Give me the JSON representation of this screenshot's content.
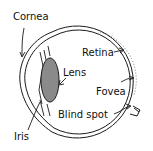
{
  "diagram": {
    "labels": {
      "cornea": "Cornea",
      "retina": "Retina",
      "lens": "Lens",
      "fovea": "Fovea",
      "blind_spot": "Blind spot",
      "iris": "Iris"
    },
    "colors": {
      "line": "#1a1a1a",
      "lens_fill": "#8a8a8a",
      "background": "#ffffff"
    }
  }
}
